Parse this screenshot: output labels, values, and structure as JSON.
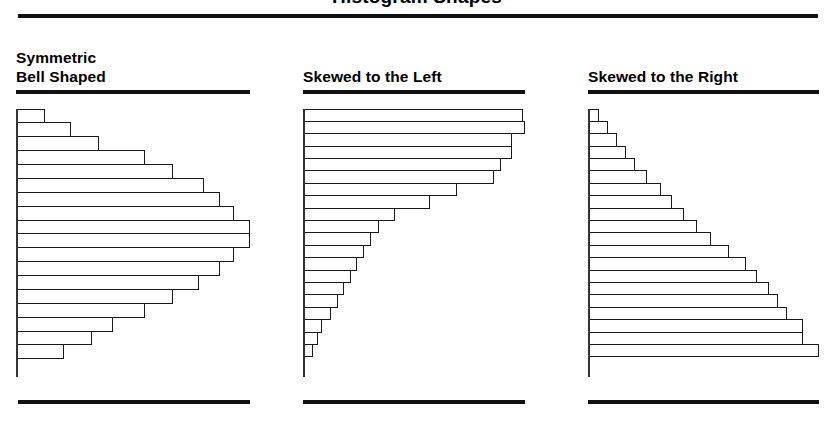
{
  "figure": {
    "title": "Histogram Shapes",
    "rule_color": "#111111",
    "bar_outline_color": "#1a1a1a",
    "bar_fill_color": "#ffffff",
    "background_color": "#ffffff"
  },
  "panels": [
    {
      "id": "symmetric-bell-shaped",
      "label": "Symmetric\nBell Shaped"
    },
    {
      "id": "skewed-to-the-left",
      "label": "Skewed to the Left"
    },
    {
      "id": "skewed-to-the-right",
      "label": "Skewed to the Right"
    }
  ],
  "chart_data": [
    {
      "type": "bar",
      "orientation": "horizontal",
      "title": "Symmetric Bell Shaped",
      "xlabel": "Frequency",
      "ylabel": "",
      "grid": false,
      "legend": "none",
      "axis_ticks": [],
      "tick_labels": [],
      "xlim": [
        0,
        100
      ],
      "categories": [
        "1",
        "2",
        "3",
        "4",
        "5",
        "6",
        "7",
        "8",
        "9",
        "10",
        "11",
        "12",
        "13",
        "14",
        "15",
        "16",
        "17",
        "18"
      ],
      "values": [
        12,
        23,
        35,
        55,
        67,
        80,
        87,
        93,
        100,
        100,
        93,
        87,
        78,
        67,
        55,
        41,
        32,
        20
      ],
      "note": "Bell-shaped, roughly symmetric about the middle classes"
    },
    {
      "type": "bar",
      "orientation": "horizontal",
      "title": "Skewed to the Left",
      "xlabel": "Frequency",
      "ylabel": "",
      "grid": false,
      "legend": "none",
      "axis_ticks": [],
      "tick_labels": [],
      "xlim": [
        0,
        100
      ],
      "categories": [
        "1",
        "2",
        "3",
        "4",
        "5",
        "6",
        "7",
        "8",
        "9",
        "10",
        "11",
        "12",
        "13",
        "14",
        "15",
        "16",
        "17",
        "18",
        "19",
        "20"
      ],
      "values": [
        99,
        100,
        94,
        94,
        89,
        86,
        69,
        57,
        41,
        34,
        30,
        27,
        24,
        21,
        18,
        15,
        12,
        8,
        6,
        4
      ],
      "note": "Long tail extending toward the lower (left) classes"
    },
    {
      "type": "bar",
      "orientation": "horizontal",
      "title": "Skewed to the Right",
      "xlabel": "Frequency",
      "ylabel": "",
      "grid": false,
      "legend": "none",
      "axis_ticks": [],
      "tick_labels": [],
      "xlim": [
        0,
        100
      ],
      "categories": [
        "1",
        "2",
        "3",
        "4",
        "5",
        "6",
        "7",
        "8",
        "9",
        "10",
        "11",
        "12",
        "13",
        "14",
        "15",
        "16",
        "17",
        "18",
        "19",
        "20"
      ],
      "values": [
        4,
        8,
        12,
        16,
        20,
        25,
        31,
        36,
        41,
        47,
        53,
        61,
        68,
        73,
        78,
        82,
        86,
        93,
        93,
        100
      ],
      "note": "Long tail extending toward the higher (right) classes"
    }
  ]
}
